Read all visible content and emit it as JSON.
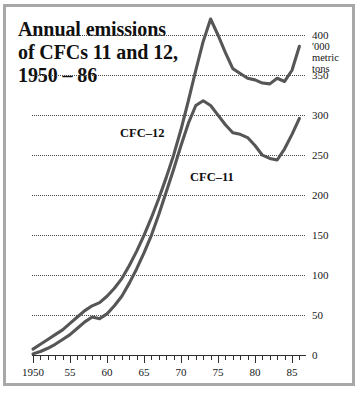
{
  "figure": {
    "title_lines": [
      "Annual emissions",
      "of CFCs 11 and 12,",
      "1950 – 86"
    ],
    "unit_caption": [
      "'000",
      "metric",
      "tons"
    ],
    "frame_color": "#a8a8a8",
    "line_color": "#565656",
    "axis_color": "#2e2e2e",
    "background": "#ffffff"
  },
  "chart_data": {
    "type": "line",
    "title": "Annual emissions of CFCs 11 and 12, 1950 – 86",
    "xlabel": "",
    "ylabel": "'000 metric tons",
    "xlim": [
      1950,
      1987
    ],
    "ylim": [
      0,
      425
    ],
    "grid": true,
    "legend": "inline-annotation",
    "y_ticks": [
      0,
      50,
      100,
      150,
      200,
      250,
      300,
      350,
      400
    ],
    "y_tick_labels": [
      "0",
      "50",
      "100",
      "150",
      "200",
      "250",
      "300",
      "350",
      "400"
    ],
    "x_ticks": [
      1950,
      1955,
      1960,
      1965,
      1970,
      1975,
      1980,
      1985
    ],
    "x_tick_labels": [
      "1950",
      "55",
      "60",
      "65",
      "70",
      "75",
      "80",
      "85"
    ],
    "x_minor_step": 1,
    "x": [
      1950,
      1951,
      1952,
      1953,
      1954,
      1955,
      1956,
      1957,
      1958,
      1959,
      1960,
      1961,
      1962,
      1963,
      1964,
      1965,
      1966,
      1967,
      1968,
      1969,
      1970,
      1971,
      1972,
      1973,
      1974,
      1975,
      1976,
      1977,
      1978,
      1979,
      1980,
      1981,
      1982,
      1983,
      1984,
      1985,
      1986
    ],
    "series": [
      {
        "name": "CFC–12",
        "label": "CFC–12",
        "values": [
          8,
          14,
          20,
          26,
          32,
          40,
          48,
          56,
          62,
          66,
          74,
          84,
          96,
          112,
          130,
          150,
          172,
          196,
          222,
          250,
          282,
          318,
          356,
          392,
          420,
          400,
          378,
          358,
          352,
          346,
          344,
          340,
          339,
          346,
          342,
          356,
          386
        ]
      },
      {
        "name": "CFC–11",
        "label": "CFC–11",
        "values": [
          2,
          5,
          9,
          14,
          20,
          26,
          34,
          42,
          48,
          46,
          52,
          62,
          74,
          90,
          108,
          128,
          150,
          176,
          204,
          232,
          262,
          290,
          312,
          318,
          312,
          300,
          288,
          278,
          276,
          272,
          262,
          250,
          246,
          244,
          258,
          276,
          296
        ]
      }
    ]
  },
  "axis": {
    "y_labels": [
      {
        "value": "400",
        "y": 31
      },
      {
        "value": "350",
        "y": 85
      },
      {
        "value": "300",
        "y": 126
      },
      {
        "value": "250",
        "y": 166
      },
      {
        "value": "200",
        "y": 207
      },
      {
        "value": "150",
        "y": 234
      },
      {
        "value": "100",
        "y": 275
      },
      {
        "value": "50",
        "y": 315
      },
      {
        "value": "0",
        "y": 352
      }
    ],
    "x_labels": [
      {
        "value": "1950",
        "x": 33
      },
      {
        "value": "55",
        "x": 70
      },
      {
        "value": "60",
        "x": 107
      },
      {
        "value": "65",
        "x": 144
      },
      {
        "value": "70",
        "x": 181
      },
      {
        "value": "75",
        "x": 218
      },
      {
        "value": "80",
        "x": 255
      },
      {
        "value": "85",
        "x": 292
      }
    ]
  }
}
